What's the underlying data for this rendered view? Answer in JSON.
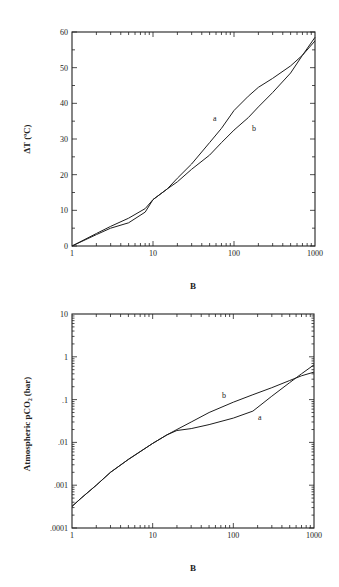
{
  "chart_data": [
    {
      "type": "line",
      "title": "",
      "xlabel": "B",
      "ylabel": "ΔT (ºC)",
      "xscale": "log",
      "yscale": "linear",
      "xlim": [
        1,
        1000
      ],
      "ylim": [
        0,
        60
      ],
      "xticks": [
        "1",
        "10",
        "100",
        "1000"
      ],
      "yticks": [
        "0",
        "10",
        "20",
        "30",
        "40",
        "50",
        "60"
      ],
      "grid": false,
      "legend": "inline labels",
      "series": [
        {
          "name": "a",
          "x": [
            1,
            2,
            3,
            5,
            8,
            10,
            15,
            20,
            30,
            50,
            70,
            100,
            150,
            200,
            300,
            500,
            700,
            1000
          ],
          "values": [
            0,
            3.5,
            5.5,
            7.8,
            10.5,
            13,
            16,
            19,
            23,
            29,
            33,
            38,
            42,
            44.5,
            47,
            50.5,
            53.5,
            58.5
          ]
        },
        {
          "name": "b",
          "x": [
            1,
            2,
            3,
            5,
            8,
            10,
            15,
            20,
            30,
            50,
            70,
            100,
            150,
            200,
            300,
            500,
            700,
            1000
          ],
          "values": [
            0,
            3.2,
            5.0,
            6.5,
            9.5,
            13,
            16,
            18,
            21.5,
            25.5,
            29,
            32.5,
            36,
            39,
            43,
            48.5,
            53.5,
            57.5
          ]
        }
      ]
    },
    {
      "type": "line",
      "title": "",
      "xlabel": "B",
      "ylabel": "Atmospheric pCO₂ (bar)",
      "xscale": "log",
      "yscale": "log",
      "xlim": [
        1,
        1000
      ],
      "ylim": [
        0.0001,
        10
      ],
      "xticks": [
        "1",
        "10",
        "100",
        "1000"
      ],
      "yticks": [
        ".0001",
        ".001",
        ".01",
        ".1",
        "1",
        "10"
      ],
      "grid": false,
      "legend": "inline labels",
      "series": [
        {
          "name": "a",
          "x": [
            1,
            1.3,
            2,
            3,
            5,
            10,
            15,
            20,
            30,
            50,
            100,
            175,
            300,
            500,
            700,
            1000
          ],
          "values": [
            0.00032,
            0.0005,
            0.001,
            0.002,
            0.004,
            0.0095,
            0.015,
            0.019,
            0.021,
            0.026,
            0.037,
            0.054,
            0.12,
            0.25,
            0.4,
            0.65
          ]
        },
        {
          "name": "b",
          "x": [
            1,
            1.3,
            2,
            3,
            5,
            10,
            15,
            20,
            30,
            50,
            100,
            175,
            300,
            500,
            700,
            1000
          ],
          "values": [
            0.00032,
            0.0005,
            0.001,
            0.002,
            0.004,
            0.0095,
            0.015,
            0.02,
            0.03,
            0.05,
            0.087,
            0.13,
            0.19,
            0.28,
            0.36,
            0.44
          ]
        }
      ]
    }
  ],
  "labels": {
    "top": {
      "ylabel": "ΔT  (ºC)",
      "xlabel": "B",
      "series_a": "a",
      "series_b": "b"
    },
    "bottom": {
      "ylabel": "Atmospheric  pCO₂ (bar)",
      "xlabel": "B",
      "series_a": "a",
      "series_b": "b"
    }
  }
}
